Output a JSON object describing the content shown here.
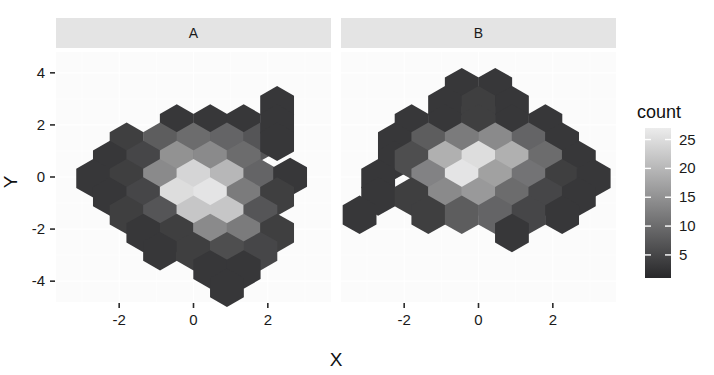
{
  "chart_data": {
    "type": "heatmap",
    "subtype": "hexbin",
    "title": "",
    "xlabel": "X",
    "ylabel": "Y",
    "legend_title": "count",
    "legend_position": "right",
    "grid": true,
    "xlim": [
      -3.7,
      3.7
    ],
    "ylim": [
      -4.8,
      4.8
    ],
    "x_ticks": [
      "-2",
      "0",
      "2"
    ],
    "x_tick_values": [
      -2,
      0,
      2
    ],
    "y_ticks": [
      "4",
      "2",
      "0",
      "-2",
      "-4"
    ],
    "y_tick_values": [
      4,
      2,
      0,
      -2,
      -4
    ],
    "color_scale": {
      "type": "sequential-grey",
      "low_color": "#28282a",
      "high_color": "#ececec",
      "vmin": 1,
      "vmax": 27,
      "ticks": [
        25,
        20,
        15,
        10,
        5
      ],
      "tick_labels": [
        "25",
        "20",
        "15",
        "10",
        "5"
      ]
    },
    "facets": [
      {
        "label": "A",
        "bins": [
          {
            "x": -0.45,
            "y": 2.05,
            "count": 3
          },
          {
            "x": 0.45,
            "y": 2.05,
            "count": 3
          },
          {
            "x": 1.35,
            "y": 2.05,
            "count": 3
          },
          {
            "x": 2.25,
            "y": 2.75,
            "count": 3
          },
          {
            "x": -1.8,
            "y": 1.35,
            "count": 4
          },
          {
            "x": -0.9,
            "y": 1.35,
            "count": 8
          },
          {
            "x": 0.0,
            "y": 1.35,
            "count": 10
          },
          {
            "x": 0.9,
            "y": 1.35,
            "count": 9
          },
          {
            "x": 1.8,
            "y": 1.35,
            "count": 7
          },
          {
            "x": 2.25,
            "y": 2.05,
            "count": 3
          },
          {
            "x": -2.25,
            "y": 0.65,
            "count": 3
          },
          {
            "x": -1.35,
            "y": 0.65,
            "count": 5
          },
          {
            "x": -0.45,
            "y": 0.65,
            "count": 15
          },
          {
            "x": 0.45,
            "y": 0.65,
            "count": 14
          },
          {
            "x": 1.35,
            "y": 0.65,
            "count": 10
          },
          {
            "x": 2.25,
            "y": 1.35,
            "count": 3
          },
          {
            "x": -2.7,
            "y": -0.05,
            "count": 3
          },
          {
            "x": -1.8,
            "y": -0.05,
            "count": 4
          },
          {
            "x": -0.9,
            "y": -0.05,
            "count": 14
          },
          {
            "x": 0.0,
            "y": -0.05,
            "count": 24
          },
          {
            "x": 0.9,
            "y": -0.05,
            "count": 20
          },
          {
            "x": 1.8,
            "y": -0.05,
            "count": 9
          },
          {
            "x": 2.6,
            "y": 0.0,
            "count": 3
          },
          {
            "x": -2.25,
            "y": -0.75,
            "count": 3
          },
          {
            "x": -1.35,
            "y": -0.75,
            "count": 5
          },
          {
            "x": -0.45,
            "y": -0.75,
            "count": 25
          },
          {
            "x": 0.45,
            "y": -0.75,
            "count": 26
          },
          {
            "x": 1.35,
            "y": -0.75,
            "count": 12
          },
          {
            "x": 2.25,
            "y": -0.75,
            "count": 4
          },
          {
            "x": -1.8,
            "y": -1.45,
            "count": 4
          },
          {
            "x": -0.9,
            "y": -1.45,
            "count": 7
          },
          {
            "x": 0.0,
            "y": -1.45,
            "count": 22
          },
          {
            "x": 0.9,
            "y": -1.45,
            "count": 22
          },
          {
            "x": 1.8,
            "y": -1.45,
            "count": 7
          },
          {
            "x": -1.35,
            "y": -2.15,
            "count": 3
          },
          {
            "x": -0.45,
            "y": -2.15,
            "count": 4
          },
          {
            "x": 0.45,
            "y": -2.15,
            "count": 14
          },
          {
            "x": 1.35,
            "y": -2.15,
            "count": 12
          },
          {
            "x": 2.25,
            "y": -2.15,
            "count": 4
          },
          {
            "x": -0.9,
            "y": -2.85,
            "count": 3
          },
          {
            "x": 0.0,
            "y": -2.85,
            "count": 4
          },
          {
            "x": 0.9,
            "y": -2.85,
            "count": 6
          },
          {
            "x": 1.8,
            "y": -2.85,
            "count": 5
          },
          {
            "x": 0.45,
            "y": -3.55,
            "count": 3
          },
          {
            "x": 1.35,
            "y": -3.55,
            "count": 3
          },
          {
            "x": 0.9,
            "y": -4.25,
            "count": 3
          }
        ]
      },
      {
        "label": "B",
        "bins": [
          {
            "x": -0.45,
            "y": 3.45,
            "count": 3
          },
          {
            "x": 0.45,
            "y": 3.45,
            "count": 3
          },
          {
            "x": -0.9,
            "y": 2.75,
            "count": 3
          },
          {
            "x": 0.0,
            "y": 2.75,
            "count": 4
          },
          {
            "x": 0.9,
            "y": 2.75,
            "count": 3
          },
          {
            "x": -1.8,
            "y": 2.05,
            "count": 3
          },
          {
            "x": -0.9,
            "y": 2.05,
            "count": 3
          },
          {
            "x": 0.0,
            "y": 2.05,
            "count": 4
          },
          {
            "x": 0.9,
            "y": 2.05,
            "count": 3
          },
          {
            "x": 1.8,
            "y": 2.05,
            "count": 3
          },
          {
            "x": -2.25,
            "y": 1.35,
            "count": 3
          },
          {
            "x": -1.35,
            "y": 1.35,
            "count": 8
          },
          {
            "x": -0.45,
            "y": 1.35,
            "count": 12
          },
          {
            "x": 0.45,
            "y": 1.35,
            "count": 14
          },
          {
            "x": 1.35,
            "y": 1.35,
            "count": 9
          },
          {
            "x": 2.25,
            "y": 1.35,
            "count": 3
          },
          {
            "x": -2.25,
            "y": 0.65,
            "count": 3
          },
          {
            "x": -1.8,
            "y": 0.65,
            "count": 6
          },
          {
            "x": -0.9,
            "y": 0.65,
            "count": 19
          },
          {
            "x": 0.0,
            "y": 0.65,
            "count": 25
          },
          {
            "x": 0.9,
            "y": 0.65,
            "count": 19
          },
          {
            "x": 1.8,
            "y": 0.65,
            "count": 10
          },
          {
            "x": 2.7,
            "y": 0.65,
            "count": 3
          },
          {
            "x": -2.7,
            "y": -0.05,
            "count": 3
          },
          {
            "x": -1.35,
            "y": -0.05,
            "count": 13
          },
          {
            "x": -0.45,
            "y": -0.05,
            "count": 26
          },
          {
            "x": 0.45,
            "y": -0.05,
            "count": 17
          },
          {
            "x": 1.35,
            "y": -0.05,
            "count": 11
          },
          {
            "x": 2.25,
            "y": -0.05,
            "count": 4
          },
          {
            "x": 3.1,
            "y": -0.05,
            "count": 3
          },
          {
            "x": -2.7,
            "y": -0.75,
            "count": 3
          },
          {
            "x": -1.8,
            "y": -0.75,
            "count": 4
          },
          {
            "x": -0.9,
            "y": -0.75,
            "count": 14
          },
          {
            "x": 0.0,
            "y": -0.75,
            "count": 16
          },
          {
            "x": 0.9,
            "y": -0.75,
            "count": 10
          },
          {
            "x": 1.8,
            "y": -0.75,
            "count": 5
          },
          {
            "x": 2.7,
            "y": -0.75,
            "count": 3
          },
          {
            "x": -3.2,
            "y": -1.45,
            "count": 3
          },
          {
            "x": -1.35,
            "y": -1.45,
            "count": 4
          },
          {
            "x": -0.45,
            "y": -1.45,
            "count": 8
          },
          {
            "x": 0.45,
            "y": -1.45,
            "count": 9
          },
          {
            "x": 1.35,
            "y": -1.45,
            "count": 5
          },
          {
            "x": 2.25,
            "y": -1.45,
            "count": 3
          },
          {
            "x": 0.9,
            "y": -2.15,
            "count": 3
          }
        ]
      }
    ]
  },
  "axes": {
    "x_title": "X",
    "y_title": "Y",
    "x_tick_labels": [
      "-2",
      "0",
      "2"
    ],
    "y_tick_labels": [
      "4",
      "2",
      "0",
      "-2",
      "-4"
    ]
  },
  "panels": [
    {
      "strip_label": "A"
    },
    {
      "strip_label": "B"
    }
  ],
  "legend": {
    "title": "count",
    "tick_labels": [
      "25",
      "20",
      "15",
      "10",
      "5"
    ]
  },
  "theme": {
    "panel_background": "#fbfbfb",
    "strip_background": "#e4e4e4",
    "gridline_color": "#ffffff",
    "text_color": "#1a1a1a",
    "low_color": "#28282a",
    "high_color": "#ececec"
  }
}
